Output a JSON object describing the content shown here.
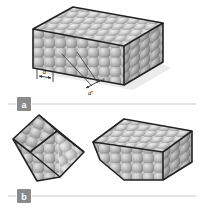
{
  "figure": {
    "panels": [
      {
        "id": "a",
        "label": "a"
      },
      {
        "id": "b",
        "label": "b"
      }
    ],
    "annotations": {
      "spacing_label": "d",
      "angle_label": "θ",
      "plane_label": "d′"
    },
    "colors": {
      "top_face": "#b9b9b9",
      "front_face": "#a8a8a8",
      "side_face": "#8f8f8f",
      "cut_face": "#c2c2c2",
      "sphere_light": "#d8d8d8",
      "sphere_dark": "#8c8c8c",
      "edge": "#222222",
      "rule": "#c9c9c9",
      "panel_box": "#8a8a8a",
      "background": "#ffffff"
    }
  }
}
